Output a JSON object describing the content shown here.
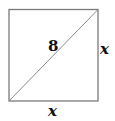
{
  "diagram": {
    "shape": "square",
    "diagonal_label": "8",
    "right_side_label": "x",
    "bottom_side_label": "x",
    "stroke_color": "#7a7a7a",
    "text_color": "#111111"
  }
}
